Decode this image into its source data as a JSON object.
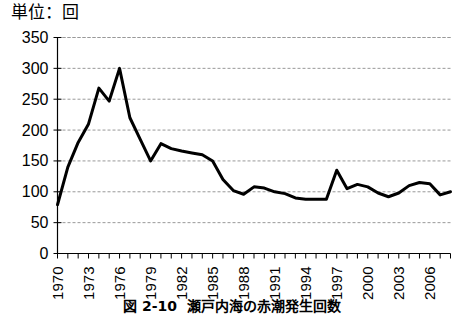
{
  "unit_label": "単位：回",
  "caption": {
    "number": "図 2-10",
    "text": "瀬戸内海の赤潮発生回数"
  },
  "colors": {
    "line": "#000000",
    "grid": "#999999",
    "axis": "#000000",
    "background": "#ffffff"
  },
  "chart_data": {
    "type": "line",
    "title": "瀬戸内海の赤潮発生回数",
    "xlabel": "",
    "ylabel": "単位：回",
    "ylim": [
      0,
      350
    ],
    "ytick_step": 50,
    "yticks": [
      0,
      50,
      100,
      150,
      200,
      250,
      300,
      350
    ],
    "grid": true,
    "legend": "none",
    "xtick_labels": [
      "1970",
      "1973",
      "1976",
      "1979",
      "1982",
      "1985",
      "1988",
      "1991",
      "1994",
      "1997",
      "2000",
      "2003",
      "2006"
    ],
    "xtick_interval": 3,
    "x": [
      1970,
      1971,
      1972,
      1973,
      1974,
      1975,
      1976,
      1977,
      1978,
      1979,
      1980,
      1981,
      1982,
      1983,
      1984,
      1985,
      1986,
      1987,
      1988,
      1989,
      1990,
      1991,
      1992,
      1993,
      1994,
      1995,
      1996,
      1997,
      1998,
      1999,
      2000,
      2001,
      2002,
      2003,
      2004,
      2005,
      2006,
      2007,
      2008
    ],
    "values": [
      79,
      140,
      180,
      210,
      268,
      247,
      300,
      220,
      185,
      150,
      178,
      170,
      166,
      163,
      160,
      150,
      120,
      102,
      96,
      108,
      106,
      100,
      97,
      90,
      88,
      88,
      88,
      135,
      105,
      112,
      108,
      98,
      92,
      98,
      110,
      115,
      113,
      95,
      100
    ],
    "series": [
      {
        "name": "赤潮発生回数",
        "values": [
          79,
          140,
          180,
          210,
          268,
          247,
          300,
          220,
          185,
          150,
          178,
          170,
          166,
          163,
          160,
          150,
          120,
          102,
          96,
          108,
          106,
          100,
          97,
          90,
          88,
          88,
          88,
          135,
          105,
          112,
          108,
          98,
          92,
          98,
          110,
          115,
          113,
          95,
          100
        ]
      }
    ]
  }
}
